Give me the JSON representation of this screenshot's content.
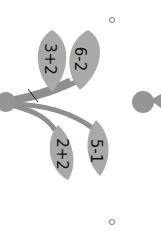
{
  "illustration": {
    "description": "branch with four leaves, each labeled with an arithmetic expression",
    "colors": {
      "leaf": "#a9a9a9",
      "leaf_shade": "#959595",
      "stem": "#8f8f8f",
      "text": "#111111"
    },
    "leaves": [
      {
        "expression": "3+2"
      },
      {
        "expression": "6-2"
      },
      {
        "expression": "2+2"
      },
      {
        "expression": "5-1"
      }
    ]
  }
}
